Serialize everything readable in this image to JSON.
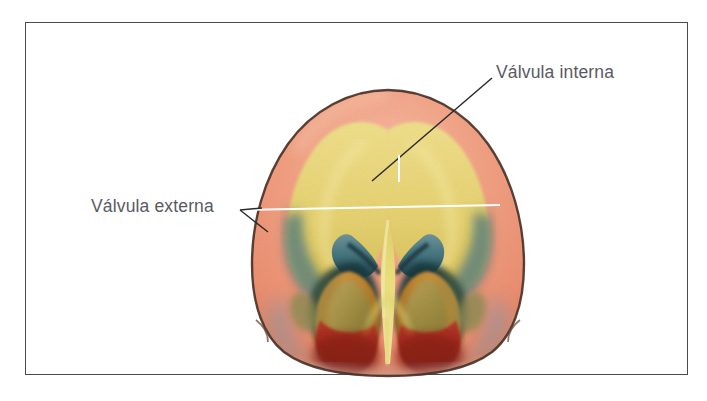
{
  "figure": {
    "type": "anatomical-illustration",
    "language": "es",
    "frame": {
      "border_color": "#4a4a4d",
      "background": "#ffffff"
    }
  },
  "labels": [
    {
      "id": "valvula-interna",
      "text": "Válvula interna",
      "color": "#5a5a5e",
      "leader_style": "diagonal-dark-line",
      "leader_color": "#2b2b2e",
      "position": "top-right"
    },
    {
      "id": "valvula-externa",
      "text": "Válvula externa",
      "color": "#5a5a5e",
      "leader_style": "horizontal-white-line-with-arrow",
      "leader_color": "#ffffff",
      "position": "left"
    }
  ],
  "palette": {
    "skin_outer": "#f2a183",
    "skin_outer_light": "#f6b9a0",
    "skin_shadow": "#e08f72",
    "cartilage_yellow": "#ead97a",
    "cartilage_yellow_deep": "#e0c95e",
    "septum_yellow": "#e8dc6e",
    "valve_teal": "#4d7a82",
    "valve_teal_dark": "#2f5259",
    "mucosa_red": "#a8291f",
    "mucosa_red_dark": "#7d1c16",
    "lobule_olive": "#8e8f48",
    "lobule_olive_light": "#a8a560",
    "ochre": "#c58c3a",
    "ochre_dark": "#9c6a26",
    "grey_blue": "#8f9aa6",
    "outline_brown": "#4a3328",
    "nostril_dark": "#123137"
  }
}
